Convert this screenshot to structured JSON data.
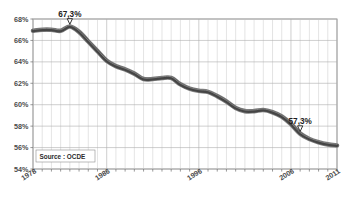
{
  "chart_data": {
    "type": "line",
    "title": "",
    "subtitle": "",
    "xlabel": "",
    "ylabel": "",
    "xlim": [
      1978,
      2011
    ],
    "ylim": [
      54,
      68
    ],
    "grid": true,
    "legend_position": "none",
    "source_note": "Source : OCDE",
    "y_ticks": [
      "68%",
      "66%",
      "64%",
      "62%",
      "60%",
      "58%",
      "56%",
      "54%"
    ],
    "y_tick_values": [
      68,
      66,
      64,
      62,
      60,
      58,
      56,
      54
    ],
    "x_ticks": [
      "1978",
      "1986",
      "1996",
      "2006",
      "2011"
    ],
    "x_tick_values": [
      1978,
      1986,
      1996,
      2006,
      2011
    ],
    "series": [
      {
        "name": "Part des salaires",
        "color": "#454545",
        "x": [
          1978,
          1979,
          1980,
          1981,
          1982,
          1983,
          1984,
          1985,
          1986,
          1987,
          1988,
          1989,
          1990,
          1991,
          1992,
          1993,
          1994,
          1995,
          1996,
          1997,
          1998,
          1999,
          2000,
          2001,
          2002,
          2003,
          2004,
          2005,
          2006,
          2007,
          2008,
          2009,
          2010,
          2011
        ],
        "values": [
          66.9,
          67.0,
          67.0,
          66.9,
          67.3,
          66.8,
          65.9,
          65.0,
          64.1,
          63.6,
          63.3,
          62.9,
          62.4,
          62.4,
          62.5,
          62.5,
          61.9,
          61.5,
          61.3,
          61.2,
          60.8,
          60.3,
          59.7,
          59.4,
          59.4,
          59.5,
          59.3,
          58.9,
          58.2,
          57.3,
          56.8,
          56.5,
          56.3,
          56.2
        ]
      }
    ],
    "annotations": [
      {
        "label": "67,3%",
        "x": 1982,
        "y": 67.3,
        "marker": "down-triangle"
      },
      {
        "label": "57,3%",
        "x": 2007,
        "y": 57.3,
        "marker": "down-triangle"
      }
    ]
  }
}
